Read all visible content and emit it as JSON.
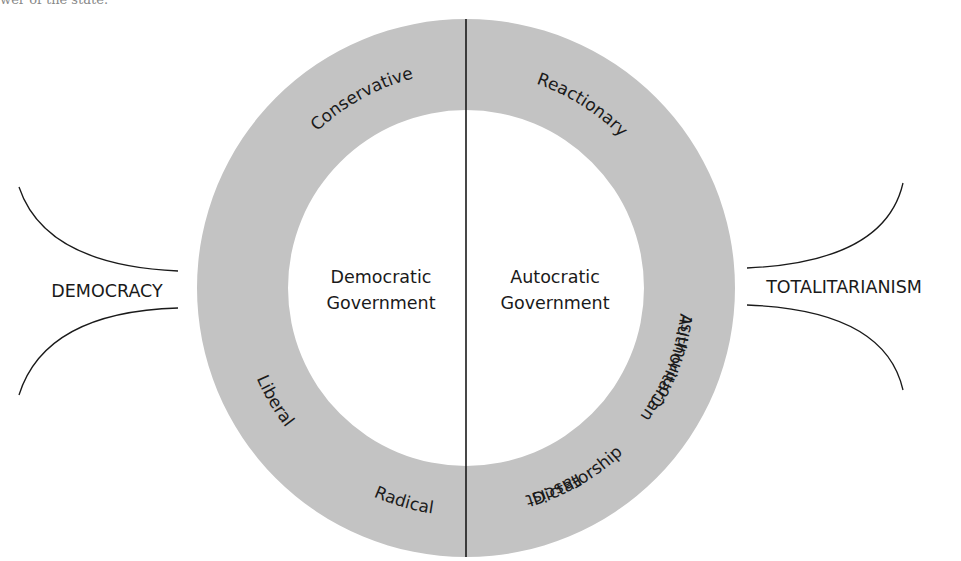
{
  "caption_fragment": "wer of the state.",
  "colors": {
    "ring": "#c3c3c3",
    "line": "#1a1a1a",
    "text": "#1a1a1a",
    "background": "#ffffff"
  },
  "geometry": {
    "cx": 466,
    "cy": 288,
    "outer_radius": 269,
    "inner_radius": 178
  },
  "left_pole": {
    "label": "DEMOCRACY"
  },
  "right_pole": {
    "label": "TOTALITARIANISM"
  },
  "halves": {
    "left": {
      "line1": "Democratic",
      "line2": "Government"
    },
    "right": {
      "line1": "Autocratic",
      "line2": "Government"
    }
  },
  "ring_labels": {
    "reactionary": "Reactionary",
    "conservative": "Conservative",
    "liberal": "Liberal",
    "radical": "Radical",
    "authoritarian": "Authoritarian",
    "fascist": "Fascist",
    "communist": "Communist",
    "dictatorship": "Dictatorship"
  }
}
